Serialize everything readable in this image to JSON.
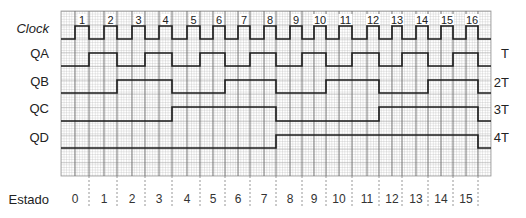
{
  "labels": {
    "clock": "Clock",
    "estado": "Estado"
  },
  "clock": {
    "pulse_numbers": [
      "1",
      "2",
      "3",
      "4",
      "5",
      "6",
      "7",
      "8",
      "9",
      "10",
      "11",
      "12",
      "13",
      "14",
      "15",
      "16"
    ]
  },
  "signals": [
    {
      "name": "QA",
      "period": "T",
      "levels": [
        0,
        1,
        0,
        1,
        0,
        1,
        0,
        1,
        0,
        1,
        0,
        1,
        0,
        1,
        0,
        1,
        0
      ]
    },
    {
      "name": "QB",
      "period": "2T",
      "levels": [
        0,
        0,
        1,
        1,
        0,
        0,
        1,
        1,
        0,
        0,
        1,
        1,
        0,
        0,
        1,
        1,
        0
      ]
    },
    {
      "name": "QC",
      "period": "3T",
      "levels": [
        0,
        0,
        0,
        0,
        1,
        1,
        1,
        1,
        0,
        0,
        0,
        0,
        1,
        1,
        1,
        1,
        0
      ]
    },
    {
      "name": "QD",
      "period": "4T",
      "levels": [
        0,
        0,
        0,
        0,
        0,
        0,
        0,
        0,
        1,
        1,
        1,
        1,
        1,
        1,
        1,
        1,
        0
      ]
    }
  ],
  "states": [
    "0",
    "1",
    "2",
    "3",
    "4",
    "5",
    "6",
    "7",
    "8",
    "9",
    "10",
    "11",
    "12",
    "13",
    "14",
    "15"
  ],
  "colors": {
    "signal": "#1c1c1c",
    "grid_fine": "#b6b6b6",
    "grid_mid": "#9a9a9a",
    "grid_edge": "#6e6e6e",
    "state_divider": "#8a8a8a"
  }
}
